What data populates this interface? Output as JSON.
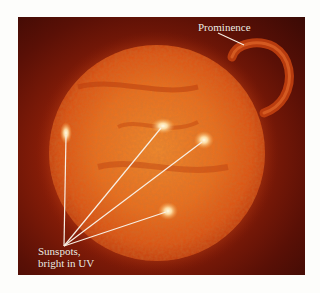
{
  "figure": {
    "colors": {
      "page_background": "#fdfdfb",
      "space_dark": "#3a0a05",
      "space_mid": "#8a1e08",
      "sun_core": "#f07a22",
      "sun_limb": "#d44a10",
      "sunspot_glow": "#fff6d8",
      "label_text": "#f6ece2",
      "leader_line": "#f8efe4"
    },
    "sun": {
      "cx": 139,
      "cy": 136,
      "r": 108
    },
    "prominence": {
      "label": "Prominence",
      "leader": {
        "x1": 200,
        "y1": 16,
        "x2": 226,
        "y2": 28
      }
    },
    "sunspots": {
      "label_line1": "Sunspots,",
      "label_line2": "bright in UV",
      "convergence": {
        "x": 46,
        "y": 229
      },
      "points": [
        {
          "x": 48,
          "y": 116
        },
        {
          "x": 145,
          "y": 109
        },
        {
          "x": 186,
          "y": 123
        },
        {
          "x": 150,
          "y": 194
        }
      ]
    }
  }
}
